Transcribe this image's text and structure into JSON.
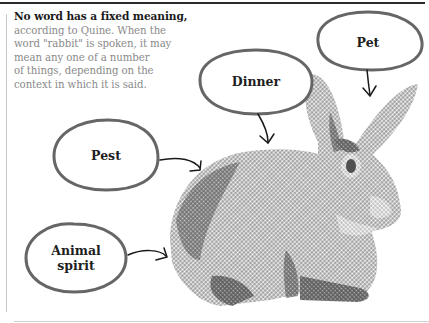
{
  "caption": {
    "lead": "No word has a fixed meaning,",
    "lines": [
      "according to Quine. When the",
      "word \"rabbit\" is spoken, it may",
      "mean any one of a number",
      "of things, depending on the",
      "context in which it is said."
    ]
  },
  "bubbles": {
    "pet": {
      "label": "Pet"
    },
    "dinner": {
      "label": "Dinner"
    },
    "pest": {
      "label": "Pest"
    },
    "animal_spirit": {
      "label_line1": "Animal",
      "label_line2": "spirit"
    }
  },
  "illustration": {
    "subject": "rabbit-halftone",
    "colors": {
      "halftone": "#6e6e6e",
      "halftone_dark": "#4f4f4f",
      "bubble_outline": "#666666",
      "arrow": "#1a1a1a",
      "top_rule": "#2b2b2b"
    }
  }
}
